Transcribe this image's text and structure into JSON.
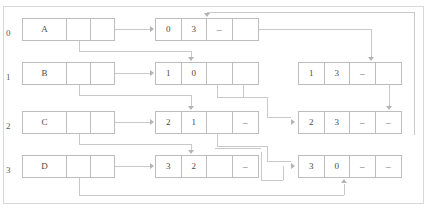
{
  "diagram": {
    "frame_color": "#d8d8d8",
    "line_color": "#c9c9c9",
    "box_color": "#bdbdbd",
    "text_color": "#4a4a4a",
    "row_labels": [
      "0",
      "1",
      "2",
      "3"
    ],
    "vertex_nodes": [
      {
        "name": "vertex-node-a",
        "label": "A",
        "cells": [
          "A",
          "",
          ""
        ]
      },
      {
        "name": "vertex-node-b",
        "label": "B",
        "cells": [
          "B",
          "",
          ""
        ]
      },
      {
        "name": "vertex-node-c",
        "label": "C",
        "cells": [
          "C",
          "",
          ""
        ]
      },
      {
        "name": "vertex-node-d",
        "label": "D",
        "cells": [
          "D",
          "",
          ""
        ]
      }
    ],
    "edge_nodes_middle": [
      {
        "name": "edge-node-0-3",
        "cells": [
          "0",
          "3",
          "–",
          ""
        ]
      },
      {
        "name": "edge-node-1-0",
        "cells": [
          "1",
          "0",
          "",
          ""
        ]
      },
      {
        "name": "edge-node-2-1",
        "cells": [
          "2",
          "1",
          "",
          "–"
        ]
      },
      {
        "name": "edge-node-3-2",
        "cells": [
          "3",
          "2",
          "",
          "–"
        ]
      }
    ],
    "edge_nodes_right": [
      {
        "name": "edge-node-1-3",
        "cells": [
          "1",
          "3",
          "–",
          ""
        ]
      },
      {
        "name": "edge-node-2-3",
        "cells": [
          "2",
          "3",
          "–",
          "–"
        ]
      },
      {
        "name": "edge-node-3-0",
        "cells": [
          "3",
          "0",
          "–",
          "–"
        ]
      }
    ]
  }
}
